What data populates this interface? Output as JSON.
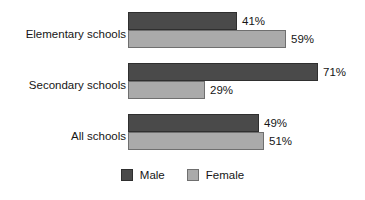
{
  "chart_data": {
    "type": "bar",
    "orientation": "horizontal",
    "title": "",
    "xlabel": "",
    "ylabel": "",
    "xlim": [
      0,
      100
    ],
    "grid": false,
    "value_suffix": "%",
    "legend_position": "bottom-center",
    "categories": [
      "Elementary schools",
      "Secondary schools",
      "All schools"
    ],
    "series": [
      {
        "name": "Male",
        "color": "#4a4a4a",
        "values": [
          41,
          71,
          49
        ],
        "labels": [
          "41%",
          "71%",
          "49%"
        ]
      },
      {
        "name": "Female",
        "color": "#aaaaaa",
        "values": [
          59,
          29,
          51
        ],
        "labels": [
          "59%",
          "29%",
          "51%"
        ]
      }
    ]
  },
  "groups": [
    {
      "label": "Elementary schools",
      "male": {
        "label": "41%",
        "value": 41
      },
      "female": {
        "label": "59%",
        "value": 59
      }
    },
    {
      "label": "Secondary schools",
      "male": {
        "label": "71%",
        "value": 71
      },
      "female": {
        "label": "29%",
        "value": 29
      }
    },
    {
      "label": "All schools",
      "male": {
        "label": "49%",
        "value": 49
      },
      "female": {
        "label": "51%",
        "value": 51
      }
    }
  ],
  "legend": {
    "items": [
      {
        "label": "Male",
        "color": "#4a4a4a"
      },
      {
        "label": "Female",
        "color": "#aaaaaa"
      }
    ]
  }
}
